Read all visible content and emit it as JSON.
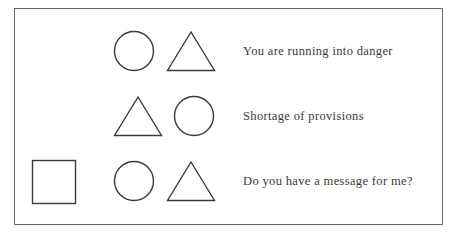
{
  "page": {
    "background_color": "#ffffff",
    "frame_border_color": "#6b6b6b",
    "shape_stroke_color": "#3a3a3a",
    "text_color": "#3a3a3a"
  },
  "rows": [
    {
      "shapes": [
        "circle",
        "triangle"
      ],
      "message": "You are running into danger"
    },
    {
      "shapes": [
        "triangle",
        "circle"
      ],
      "message": "Shortage of provisions"
    },
    {
      "shapes": [
        "square",
        "circle",
        "triangle"
      ],
      "message": "Do you have a message for me?"
    }
  ]
}
